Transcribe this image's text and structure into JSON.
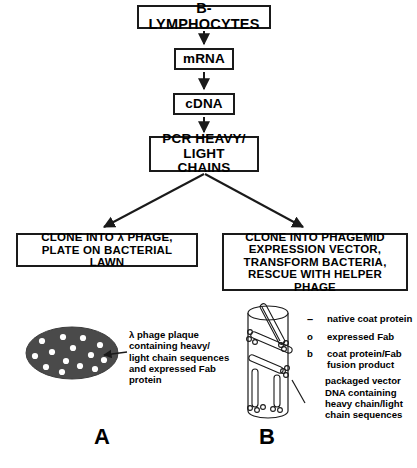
{
  "diagram": {
    "title_flow": "Antibody library construction flowchart",
    "boxes": {
      "b_lymphocytes": "B-LYMPHOCYTES",
      "mrna": "mRNA",
      "cdna": "cDNA",
      "pcr": "PCR HEAVY/\nLIGHT CHAINS",
      "clone_lambda": "CLONE INTO λ PHAGE,\nPLATE ON BACTERIAL LAWN",
      "clone_phagemid": "CLONE INTO PHAGEMID\nEXPRESSION VECTOR,\nTRANSFORM BACTERIA,\nRESCUE WITH HELPER PHAGE"
    },
    "panel_a": {
      "label": "A",
      "caption": "λ phage plaque\ncontaining heavy/\nlight chain sequences\nand expressed Fab\nprotein",
      "plaque_fill": "#4a4a4a",
      "plaque_dot_color": "#ffffff",
      "plaque_dot_count": 14
    },
    "panel_b": {
      "label": "B",
      "legend": [
        {
          "symbol": "–",
          "symbol_name": "dash-symbol",
          "text": "native coat protein"
        },
        {
          "symbol": "o",
          "symbol_name": "circle-symbol",
          "text": "expressed Fab"
        },
        {
          "symbol": "b",
          "symbol_name": "b-symbol",
          "text": "coat protein/Fab\nfusion product"
        },
        {
          "symbol": "",
          "symbol_name": "slash-symbol",
          "text": "packaged vector\nDNA containing\nheavy chain/light\nchain sequences"
        }
      ]
    },
    "colors": {
      "stroke": "#1a1a1a",
      "background": "#ffffff",
      "plaque": "#4a4a4a"
    }
  }
}
